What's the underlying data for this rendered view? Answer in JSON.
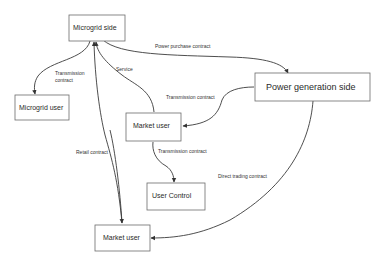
{
  "diagram": {
    "nodes": [
      {
        "id": "microgrid_side",
        "label": "Microgrid side"
      },
      {
        "id": "microgrid_user",
        "label": "Microgrid user"
      },
      {
        "id": "market_user_mid",
        "label": "Market user"
      },
      {
        "id": "power_generation_side",
        "label": "Power generation side"
      },
      {
        "id": "user_control",
        "label": "User Control"
      },
      {
        "id": "market_user_bottom",
        "label": "Market user"
      }
    ],
    "edges": [
      {
        "from": "microgrid_side",
        "to": "power_generation_side",
        "label": "Power purchase contract"
      },
      {
        "from": "microgrid_side",
        "to": "microgrid_user",
        "label_lines": [
          "Transmission",
          "contract"
        ]
      },
      {
        "from": "market_user_mid",
        "to": "microgrid_side",
        "label": "Service"
      },
      {
        "from": "power_generation_side",
        "to": "market_user_mid",
        "label": "Transmission contract"
      },
      {
        "from": "market_user_mid",
        "to": "user_control",
        "label": "Transmission contract"
      },
      {
        "from": "microgrid_side",
        "to": "market_user_bottom",
        "label": "Retail contract",
        "note": "bidirectional"
      },
      {
        "from": "power_generation_side",
        "to": "market_user_bottom",
        "label": "Direct trading contract"
      }
    ]
  }
}
